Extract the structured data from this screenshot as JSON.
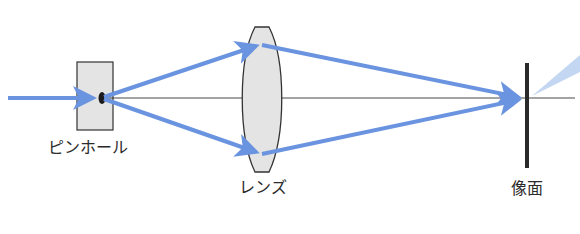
{
  "labels": {
    "pinhole": "ピンホール",
    "lens": "レンズ",
    "image_plane": "像面"
  },
  "colors": {
    "ray": "#6a93e0",
    "ray_light": "#c3d6f2",
    "axis": "#333333",
    "box_fill": "#e4e4e4",
    "lens_fill": "#e4e4e4",
    "outline": "#333333",
    "image_plane": "#2a2a2a"
  },
  "components": [
    {
      "id": "pinhole",
      "type": "aperture",
      "label": "ピンホール"
    },
    {
      "id": "lens",
      "type": "convex-lens",
      "label": "レンズ"
    },
    {
      "id": "image_plane",
      "type": "screen",
      "label": "像面"
    }
  ]
}
